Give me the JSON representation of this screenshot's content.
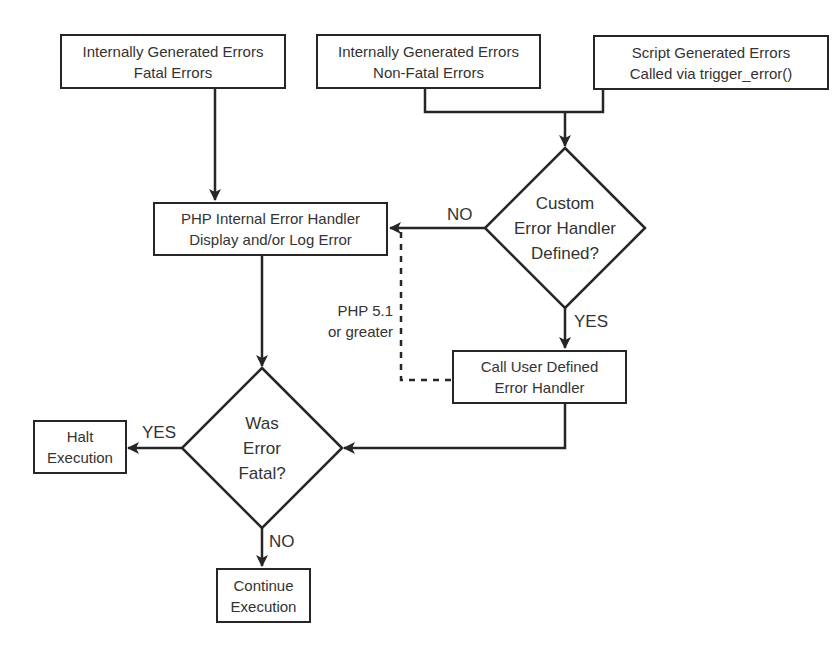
{
  "diagram": {
    "type": "flowchart",
    "title": "",
    "nodes": {
      "internal_fatal": {
        "line1": "Internally Generated Errors",
        "line2": "Fatal Errors",
        "shape": "rectangle"
      },
      "internal_nonfatal": {
        "line1": "Internally Generated Errors",
        "line2": "Non-Fatal Errors",
        "shape": "rectangle"
      },
      "script_generated": {
        "line1": "Script Generated Errors",
        "line2": "Called via trigger_error()",
        "shape": "rectangle"
      },
      "custom_handler_decision": {
        "line1": "Custom",
        "line2": "Error Handler",
        "line3": "Defined?",
        "shape": "diamond"
      },
      "php_internal_handler": {
        "line1": "PHP Internal Error Handler",
        "line2": "Display and/or Log Error",
        "shape": "rectangle"
      },
      "call_user_handler": {
        "line1": "Call User Defined",
        "line2": "Error Handler",
        "shape": "rectangle"
      },
      "fatal_decision": {
        "line1": "Was",
        "line2": "Error",
        "line3": "Fatal?",
        "shape": "diamond"
      },
      "halt": {
        "line1": "Halt",
        "line2": "Execution",
        "shape": "rectangle"
      },
      "continue": {
        "line1": "Continue",
        "line2": "Execution",
        "shape": "rectangle"
      }
    },
    "edge_labels": {
      "custom_no": "NO",
      "custom_yes": "YES",
      "fatal_yes": "YES",
      "fatal_no": "NO",
      "dashed_note_line1": "PHP 5.1",
      "dashed_note_line2": "or greater"
    },
    "edges": [
      {
        "from": "internal_fatal",
        "to": "php_internal_handler",
        "style": "solid"
      },
      {
        "from": "internal_nonfatal",
        "to": "custom_handler_decision",
        "style": "solid"
      },
      {
        "from": "script_generated",
        "to": "custom_handler_decision",
        "style": "solid"
      },
      {
        "from": "custom_handler_decision",
        "to": "php_internal_handler",
        "label": "NO",
        "style": "solid"
      },
      {
        "from": "custom_handler_decision",
        "to": "call_user_handler",
        "label": "YES",
        "style": "solid"
      },
      {
        "from": "call_user_handler",
        "to": "php_internal_handler",
        "label": "PHP 5.1 or greater",
        "style": "dashed"
      },
      {
        "from": "php_internal_handler",
        "to": "fatal_decision",
        "style": "solid"
      },
      {
        "from": "call_user_handler",
        "to": "fatal_decision",
        "style": "solid"
      },
      {
        "from": "fatal_decision",
        "to": "halt",
        "label": "YES",
        "style": "solid"
      },
      {
        "from": "fatal_decision",
        "to": "continue",
        "label": "NO",
        "style": "solid"
      }
    ],
    "colors": {
      "stroke": "#262626",
      "text": "#333333",
      "background": "#ffffff"
    }
  }
}
